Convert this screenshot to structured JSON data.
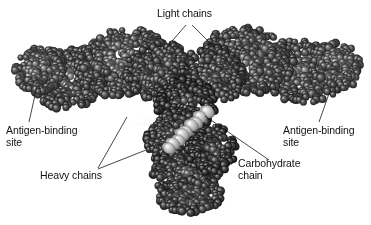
{
  "figure": {
    "background_color": "#ffffff",
    "width": 371,
    "height": 225,
    "render_style": "grayscale space-filling (CPK) atomic spheres"
  },
  "labels": {
    "light_chains": "Light chains",
    "antigen_binding_site_left": "Antigen-binding\nsite",
    "antigen_binding_site_right": "Antigen-binding\nsite",
    "heavy_chains": "Heavy chains",
    "carbohydrate_chain": "Carbohydrate\nchain"
  },
  "colors": {
    "text": "#111111",
    "leader_line": "#1a1a1a",
    "protein_dark": "#4a4a4a",
    "protein_mid": "#7b7b7b",
    "protein_light": "#b4b4b4",
    "carbohydrate": "#dcdcdc",
    "shadow": "#c8c8c8"
  },
  "leader_lines": [
    {
      "name": "light-chains-left",
      "x1": 186,
      "y1": 25,
      "x2": 166,
      "y2": 48
    },
    {
      "name": "light-chains-right",
      "x1": 192,
      "y1": 25,
      "x2": 212,
      "y2": 45
    },
    {
      "name": "antigen-left",
      "x1": 37,
      "y1": 86,
      "x2": 29,
      "y2": 122
    },
    {
      "name": "antigen-right",
      "x1": 331,
      "y1": 88,
      "x2": 319,
      "y2": 122
    },
    {
      "name": "heavy-chains-upper",
      "x1": 127,
      "y1": 117,
      "x2": 98,
      "y2": 168
    },
    {
      "name": "heavy-chains-lower",
      "x1": 146,
      "y1": 150,
      "x2": 98,
      "y2": 169
    },
    {
      "name": "carbohydrate",
      "x1": 205,
      "y1": 116,
      "x2": 269,
      "y2": 160
    }
  ],
  "molecule": {
    "description": "Y-shaped immunoglobulin: two Fab arms extending up-left and up-right, Fc stem descending at center",
    "regions": [
      {
        "name": "fab-arm-left",
        "cx": 105,
        "cy": 70,
        "rx": 88,
        "ry": 40,
        "angle": -12
      },
      {
        "name": "fab-arm-right",
        "cx": 266,
        "cy": 68,
        "rx": 88,
        "ry": 40,
        "angle": 10
      },
      {
        "name": "fc-stem",
        "cx": 183,
        "cy": 150,
        "rx": 44,
        "ry": 55,
        "angle": 0
      },
      {
        "name": "carbohydrate-chain",
        "cx": 190,
        "cy": 112,
        "rx": 26,
        "ry": 10,
        "angle": -38
      }
    ]
  }
}
